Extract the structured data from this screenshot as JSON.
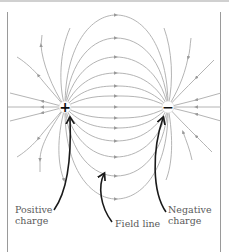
{
  "diagram": {
    "charges": [
      {
        "id": "positive",
        "symbol": "+",
        "x": 65,
        "y": 107
      },
      {
        "id": "negative",
        "symbol": "−",
        "x": 168,
        "y": 107
      }
    ],
    "labels": {
      "positive": "Positive\ncharge",
      "field_line": "Field line",
      "negative": "Negative\ncharge"
    },
    "colors": {
      "field_line": "#a8a8a8",
      "arrowhead": "#9a9a9a",
      "pointer": "#1a1a1a",
      "label_text": "#5a5a5a",
      "frame": "#9a9a9a"
    }
  }
}
